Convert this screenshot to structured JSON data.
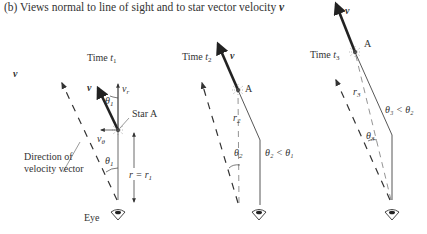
{
  "caption": {
    "prefix": "(b) Views normal to line of sight and to star vector velocity ",
    "vector_symbol": "v"
  },
  "legend": {
    "v_label": "v",
    "direction_label_line1": "Direction of",
    "direction_label_line2": "velocity vector"
  },
  "panels": [
    {
      "time_label": "Time ",
      "time_var": "t",
      "time_sub": "1",
      "v_label": "v",
      "vr_label": "v",
      "vr_sub": "r",
      "vtheta_label": "v",
      "vtheta_sub": "θ",
      "theta_label": "θ",
      "theta_sub": "1",
      "theta_lower_label": "θ",
      "theta_lower_sub": "1",
      "star_label": "Star A",
      "r_label": "r = r",
      "r_sub": "1",
      "eye_label": "Eye"
    },
    {
      "time_label": "Time ",
      "time_var": "t",
      "time_sub": "2",
      "v_label": "v",
      "star_label": "A",
      "r_label": "r",
      "r_sub": "2",
      "theta_label": "θ",
      "theta_sub": "2",
      "relation": "θ₂ < θ₁"
    },
    {
      "time_label": "Time ",
      "time_var": "t",
      "time_sub": "3",
      "v_label": "v",
      "star_label": "A",
      "r_label": "r",
      "r_sub": "3",
      "theta_label": "θ",
      "theta_sub": "3",
      "relation": "θ₃ < θ₂"
    }
  ],
  "icons": [
    "eye-icon",
    "eye-icon",
    "eye-icon",
    "star-icon",
    "star-icon",
    "star-icon"
  ]
}
